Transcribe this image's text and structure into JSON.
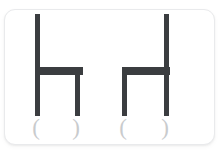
{
  "card": {
    "background_color": "#ffffff",
    "border_color": "#e9eaec",
    "corner_radius_px": 11
  },
  "palette": {
    "stroke_color": "#3b3d40",
    "paren_color": "#c9cbcd",
    "page_background": "#ffffff"
  },
  "figures": [
    {
      "id": "chair-left",
      "name": "chair-glyph-left",
      "orientation": "back-left",
      "parts": {
        "back_post": "back-post",
        "seat_bar": "seat-bar",
        "front_leg": "front-leg",
        "rear_leg": "rear-leg"
      },
      "marks": {
        "left": "(",
        "right": ")"
      }
    },
    {
      "id": "chair-right",
      "name": "chair-glyph-right",
      "orientation": "back-right",
      "parts": {
        "back_post": "back-post",
        "seat_bar": "seat-bar",
        "front_leg": "front-leg",
        "rear_leg": "rear-leg"
      },
      "marks": {
        "left": "(",
        "right": ")"
      }
    }
  ]
}
